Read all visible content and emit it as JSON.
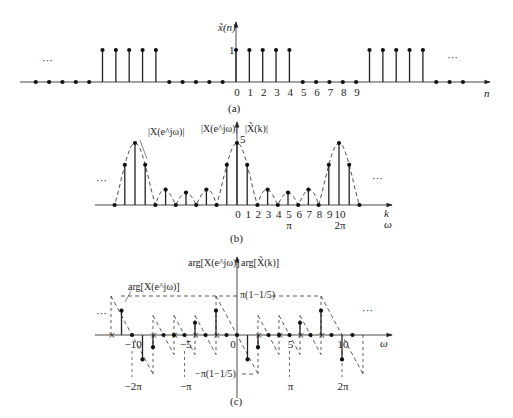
{
  "figure": {
    "panels": [
      {
        "id": "a",
        "caption": "(a)",
        "ylabel": "x̃(n)",
        "xlabel": "n",
        "ytick": "1",
        "ellipsis_left": "···",
        "ellipsis_right": "···",
        "xticks": [
          "0",
          "1",
          "2",
          "3",
          "4",
          "5",
          "6",
          "7",
          "8",
          "9"
        ]
      },
      {
        "id": "b",
        "caption": "(b)",
        "ylabel_left": "|X(e^jω)|",
        "ylabel_right": "|X̃(k)|",
        "curve_label": "|X(e^jω)|",
        "ytick": "5",
        "xlabel_k": "k",
        "xlabel_w": "ω",
        "ellipsis_left": "···",
        "ellipsis_right": "···",
        "xticks": [
          "0",
          "1",
          "2",
          "3",
          "4",
          "5",
          "6",
          "7",
          "8",
          "9",
          "10"
        ],
        "pi_ticks": [
          {
            "at": 5,
            "label": "π"
          },
          {
            "at": 10,
            "label": "2π"
          }
        ]
      },
      {
        "id": "c",
        "caption": "(c)",
        "ylabel_left": "arg[X(e^jω)]",
        "ylabel_right": "arg[X̃(k)]",
        "curve_label": "arg[X(e^jω)]",
        "xlabel": "ω",
        "upper_level": "π(1−1/5)",
        "lower_level": "−π(1−1/5)",
        "ellipsis_left": "···",
        "ellipsis_right": "···",
        "xticks": [
          {
            "at": -10,
            "label": "−10"
          },
          {
            "at": -5,
            "label": "−5"
          },
          {
            "at": 0,
            "label": "0"
          },
          {
            "at": 5,
            "label": "5"
          },
          {
            "at": 10,
            "label": "10"
          }
        ],
        "pi_ticks": [
          {
            "at": -10,
            "label": "−2π"
          },
          {
            "at": -5,
            "label": "−π"
          },
          {
            "at": 5,
            "label": "π"
          },
          {
            "at": 10,
            "label": "2π"
          }
        ]
      }
    ]
  },
  "chart_data": [
    {
      "type": "stem",
      "title": "(a) periodic sequence x̃(n), N=10",
      "xlabel": "n",
      "ylabel": "x̃(n)",
      "x": [
        -20,
        -19,
        -18,
        -17,
        -16,
        -15,
        -14,
        -13,
        -12,
        -11,
        -10,
        -9,
        -8,
        -7,
        -6,
        -5,
        -4,
        -3,
        -2,
        -1,
        0,
        1,
        2,
        3,
        4,
        5,
        6,
        7,
        8,
        9,
        10,
        11,
        12,
        13,
        14,
        15,
        16,
        17
      ],
      "values": [
        0,
        0,
        0,
        0,
        0,
        0,
        0,
        0,
        0,
        0,
        1,
        1,
        1,
        1,
        1,
        0,
        0,
        0,
        0,
        0,
        1,
        1,
        1,
        1,
        1,
        0,
        0,
        0,
        0,
        0,
        1,
        1,
        1,
        1,
        1,
        0,
        0,
        0
      ]
    },
    {
      "type": "stem",
      "title": "(b) magnitude |X̃(k)| with envelope |X(e^jω)|",
      "xlabel": "k / ω",
      "ylabel": "|X̃(k)|",
      "x": [
        -12,
        -11,
        -10,
        -9,
        -8,
        -7,
        -6,
        -5,
        -4,
        -3,
        -2,
        -1,
        0,
        1,
        2,
        3,
        4,
        5,
        6,
        7,
        8,
        9,
        10,
        11,
        12
      ],
      "values": [
        0,
        3.24,
        5,
        3.24,
        0,
        1.24,
        0,
        1,
        0,
        1.24,
        0,
        3.24,
        5,
        3.24,
        0,
        1.24,
        0,
        1,
        0,
        1.24,
        0,
        3.24,
        5,
        3.24,
        0
      ]
    },
    {
      "type": "stem",
      "title": "(c) phase arg[X̃(k)] with envelope arg[X(e^jω)]",
      "xlabel": "ω",
      "ylabel": "arg[X̃(k)]",
      "x": [
        -11,
        -10,
        -9,
        -8,
        -7,
        -6,
        -5,
        -4,
        -3,
        -2,
        -1,
        0,
        1,
        2,
        3,
        4,
        5,
        6,
        7,
        8,
        9,
        10,
        11
      ],
      "values": [
        0.5,
        0,
        -0.5,
        -0.25,
        0,
        0,
        0,
        0.25,
        0,
        0.5,
        0,
        0,
        -0.5,
        -0.25,
        0,
        0,
        0,
        0.25,
        0,
        0.5,
        0,
        -0.5,
        0
      ],
      "note": "values in units of π (approx.); discontinuity levels ±π(1−1/5)"
    }
  ]
}
